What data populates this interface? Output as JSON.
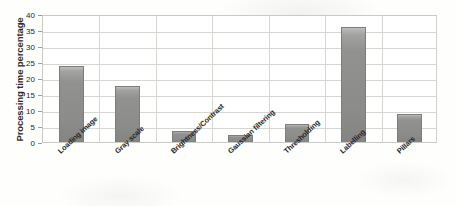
{
  "chart_data": {
    "type": "bar",
    "title": "",
    "xlabel": "",
    "ylabel": "Processing time percentage",
    "categories": [
      "Loading image",
      "Gray scale",
      "Brightness/Contrast",
      "Gaussian filtering",
      "Thresholding",
      "Labelling",
      "Pillars"
    ],
    "values": [
      23.9,
      17.6,
      3.5,
      2.3,
      5.5,
      36.0,
      8.8
    ],
    "ylim": [
      0,
      40
    ],
    "ytick_labels": [
      "0",
      "5",
      "10",
      "15",
      "20",
      "25",
      "30",
      "35",
      "40"
    ],
    "ytick_values": [
      0,
      5,
      10,
      15,
      20,
      25,
      30,
      35,
      40
    ],
    "grid": true,
    "legend": "none",
    "series": [
      {
        "name": "Processing time percentage",
        "values": [
          23.9,
          17.6,
          3.5,
          2.3,
          5.5,
          36.0,
          8.8
        ]
      }
    ]
  },
  "style": {
    "bar_color": "#8c8c8b",
    "bar_edge_color": "#7d7d7c",
    "grid_color": "#d6d6d3",
    "axis_color": "#c9c9c6",
    "text_color": "#262626",
    "background": "#fefefd"
  }
}
